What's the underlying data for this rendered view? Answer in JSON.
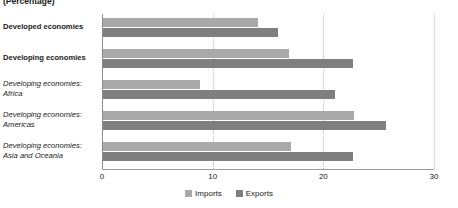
{
  "chart_data": {
    "type": "bar",
    "orientation": "horizontal",
    "title": "",
    "subtitle": "(Percentage)",
    "xlabel": "",
    "ylabel": "",
    "xlim": [
      0,
      30
    ],
    "xticks": [
      0,
      10,
      20,
      30
    ],
    "xtick_labels": [
      "0",
      "10",
      "20",
      "30"
    ],
    "grid": true,
    "grid_axis": "x",
    "legend_position": "bottom-center",
    "categories": [
      "Developed economies",
      "Developing economies",
      "Developing economies: Africa",
      "Developing economies: Americas",
      "Developing economies: Asia and Oceania"
    ],
    "series": [
      {
        "name": "Imports",
        "color": "#a9a9a9",
        "values": [
          14.0,
          16.8,
          8.8,
          22.7,
          17.0
        ]
      },
      {
        "name": "Exports",
        "color": "#7f7f7f",
        "values": [
          15.8,
          22.6,
          21.0,
          25.6,
          22.6
        ]
      }
    ]
  },
  "axis": {
    "ticks": [
      {
        "value": 0,
        "label": "0"
      },
      {
        "value": 10,
        "label": "10"
      },
      {
        "value": 20,
        "label": "20"
      },
      {
        "value": 30,
        "label": "30"
      }
    ]
  },
  "categories": [
    {
      "line1": "Developed economies",
      "line2": "",
      "style": "major"
    },
    {
      "line1": "Developing economies",
      "line2": "",
      "style": "major"
    },
    {
      "line1": "Developing economies:",
      "line2": "Africa",
      "style": "minor"
    },
    {
      "line1": "Developing economies:",
      "line2": "Americas",
      "style": "minor"
    },
    {
      "line1": "Developing economies:",
      "line2": "Asia and Oceania",
      "style": "minor"
    }
  ],
  "legend": [
    {
      "label": "Imports",
      "key": "imports"
    },
    {
      "label": "Exports",
      "key": "exports"
    }
  ],
  "subtitle": "(Percentage)",
  "colors": {
    "imports": "#a9a9a9",
    "exports": "#7f7f7f",
    "grid": "#bfbfbf",
    "axis": "#8c8c8c",
    "text": "#1a1a1a"
  }
}
